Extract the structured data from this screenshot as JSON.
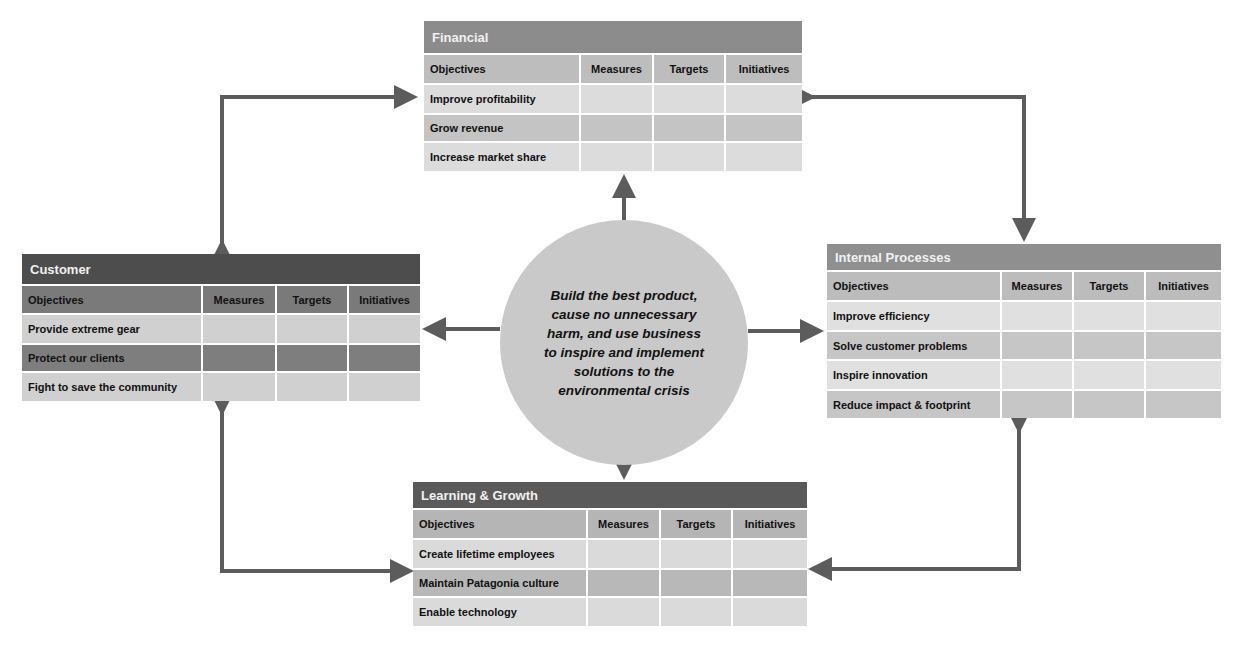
{
  "diagram": {
    "center": {
      "text": "Build the best product, cause no unnecessary harm, and use business to inspire and implement solutions to the environmental crisis"
    },
    "columns": [
      "Objectives",
      "Measures",
      "Targets",
      "Initiatives"
    ],
    "perspectives": {
      "financial": {
        "title": "Financial",
        "header_color": "#8c8c8c",
        "objectives": [
          "Improve profitability",
          "Grow revenue",
          "Increase market share"
        ]
      },
      "customer": {
        "title": "Customer",
        "header_color": "#4d4d4d",
        "objectives": [
          "Provide extreme gear",
          "Protect our clients",
          "Fight to save the community"
        ]
      },
      "internal": {
        "title": "Internal Processes",
        "header_color": "#8f8f8f",
        "objectives": [
          "Improve efficiency",
          "Solve customer problems",
          "Inspire innovation",
          "Reduce impact & footprint"
        ]
      },
      "learning": {
        "title": "Learning & Growth",
        "header_color": "#5a5a5a",
        "objectives": [
          "Create lifetime employees",
          "Maintain Patagonia culture",
          "Enable technology"
        ]
      }
    },
    "colors": {
      "arrow": "#5c5c5c",
      "circle": "#c9c9c9",
      "row_light": "#dcdcdc",
      "row_mid": "#c4c4c4",
      "row_dark": "#7a7a7a"
    }
  }
}
